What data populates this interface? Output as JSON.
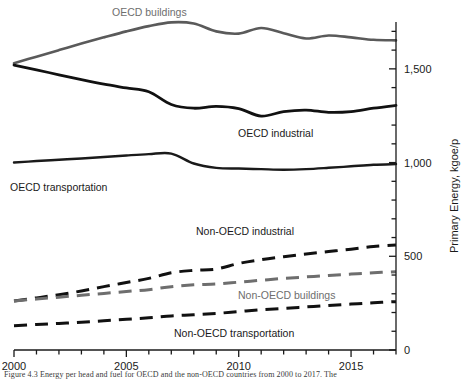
{
  "chart_data": {
    "type": "line",
    "title": "",
    "xlabel": "",
    "ylabel": "Primary Energy, kgoe/p",
    "xlim": [
      2000,
      2017
    ],
    "ylim": [
      0,
      1750
    ],
    "xticks": [
      2000,
      2005,
      2010,
      2015
    ],
    "xticklabels": [
      "2000",
      "2005",
      "2010",
      "2015"
    ],
    "yticks": [
      0,
      500,
      1000,
      1500
    ],
    "yticklabels": [
      "0",
      "500",
      "1,000",
      "1,500"
    ],
    "y_minor_step": 100,
    "x_minor_step": 1,
    "yaxis_position": "right",
    "grid": false,
    "legend": "inline-annotations",
    "x": [
      2000,
      2001,
      2002,
      2003,
      2004,
      2005,
      2006,
      2007,
      2008,
      2009,
      2010,
      2011,
      2012,
      2013,
      2014,
      2015,
      2016,
      2017
    ],
    "series": [
      {
        "name": "OECD buildings",
        "style": "solid",
        "color": "#5a5a5a",
        "width": 2.6,
        "values": [
          1530,
          1565,
          1600,
          1635,
          1668,
          1700,
          1728,
          1748,
          1742,
          1700,
          1688,
          1718,
          1690,
          1662,
          1678,
          1668,
          1655,
          1652
        ]
      },
      {
        "name": "OECD industrial",
        "style": "solid",
        "color": "#111111",
        "width": 2.8,
        "values": [
          1520,
          1495,
          1468,
          1442,
          1418,
          1398,
          1378,
          1310,
          1290,
          1300,
          1288,
          1248,
          1272,
          1280,
          1268,
          1272,
          1290,
          1305
        ]
      },
      {
        "name": "OECD transportation",
        "style": "solid",
        "color": "#1a1a1a",
        "width": 2.4,
        "values": [
          1000,
          1008,
          1015,
          1022,
          1030,
          1038,
          1045,
          1048,
          995,
          972,
          968,
          965,
          962,
          965,
          972,
          980,
          988,
          992
        ]
      },
      {
        "name": "Non-OECD industrial",
        "style": "dashed",
        "color": "#111111",
        "width": 3.0,
        "values": [
          262,
          278,
          295,
          315,
          338,
          360,
          382,
          412,
          425,
          432,
          462,
          482,
          498,
          512,
          525,
          538,
          552,
          560
        ]
      },
      {
        "name": "Non-OECD buildings",
        "style": "dashed",
        "color": "#6e6e6e",
        "width": 3.0,
        "values": [
          262,
          272,
          282,
          292,
          302,
          312,
          322,
          338,
          348,
          352,
          362,
          372,
          382,
          390,
          398,
          405,
          412,
          418
        ]
      },
      {
        "name": "Non-OECD transportation",
        "style": "dashed",
        "color": "#111111",
        "width": 3.0,
        "values": [
          130,
          136,
          142,
          148,
          156,
          164,
          172,
          182,
          188,
          195,
          205,
          215,
          222,
          230,
          238,
          245,
          252,
          258
        ]
      }
    ],
    "annotations": [
      {
        "text": "OECD buildings",
        "color": "#6e6e6e",
        "x": 112,
        "y": 16
      },
      {
        "text": "OECD industrial",
        "color": "#1a1a1a",
        "x": 238,
        "y": 137
      },
      {
        "text": "OECD transportation",
        "color": "#1a1a1a",
        "x": 10,
        "y": 191
      },
      {
        "text": "Non-OECD industrial",
        "color": "#1a1a1a",
        "x": 196,
        "y": 235
      },
      {
        "text": "Non-OECD buildings",
        "color": "#6e6e6e",
        "x": 238,
        "y": 299
      },
      {
        "text": "Non-OECD transportation",
        "color": "#1a1a1a",
        "x": 174,
        "y": 337
      }
    ]
  },
  "caption": {
    "text": "Figure 4.3 Energy per head and fuel for OECD and the non-OECD countries from 2000 to 2017. The"
  }
}
